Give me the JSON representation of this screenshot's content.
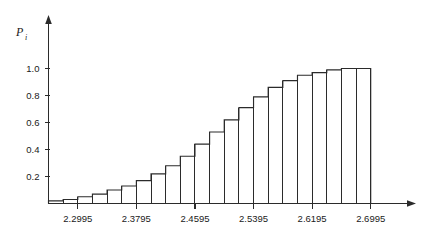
{
  "chart_data": {
    "type": "bar",
    "title": "",
    "subtitle": "",
    "xlabel": "",
    "ylabel": "P_i",
    "ylabel_base": "P",
    "ylabel_subscript": "i",
    "grid": false,
    "legend": false,
    "legend_position": "none",
    "xlim": [
      2.2595,
      2.7395
    ],
    "ylim": [
      0.0,
      1.08
    ],
    "xtick_labels": [
      "2.2995",
      "2.3795",
      "2.4595",
      "2.5395",
      "2.6195",
      "2.6995"
    ],
    "xtick_values": [
      2.2995,
      2.3795,
      2.4595,
      2.5395,
      2.6195,
      2.6995
    ],
    "xtick_step": 0.08,
    "ytick_labels": [
      "0.2",
      "0.4",
      "0.6",
      "0.8",
      "1.0"
    ],
    "ytick_values": [
      0.2,
      0.4,
      0.6,
      0.8,
      1.0
    ],
    "bar_width": 0.02,
    "categories": [
      "2.2695",
      "2.2895",
      "2.3095",
      "2.3295",
      "2.3495",
      "2.3695",
      "2.3895",
      "2.4095",
      "2.4295",
      "2.4495",
      "2.4695",
      "2.4895",
      "2.5095",
      "2.5295",
      "2.5495",
      "2.5695",
      "2.5895",
      "2.6095",
      "2.6295",
      "2.6495",
      "2.6695",
      "2.6895"
    ],
    "x": [
      2.2695,
      2.2895,
      2.3095,
      2.3295,
      2.3495,
      2.3695,
      2.3895,
      2.4095,
      2.4295,
      2.4495,
      2.4695,
      2.4895,
      2.5095,
      2.5295,
      2.5495,
      2.5695,
      2.5895,
      2.6095,
      2.6295,
      2.6495,
      2.6695,
      2.6895
    ],
    "values": [
      0.02,
      0.03,
      0.05,
      0.07,
      0.1,
      0.13,
      0.17,
      0.22,
      0.28,
      0.35,
      0.44,
      0.53,
      0.62,
      0.71,
      0.79,
      0.86,
      0.91,
      0.95,
      0.97,
      0.99,
      1.0,
      1.0
    ],
    "series": [
      {
        "name": "P_i",
        "values": [
          0.02,
          0.03,
          0.05,
          0.07,
          0.1,
          0.13,
          0.17,
          0.22,
          0.28,
          0.35,
          0.44,
          0.53,
          0.62,
          0.71,
          0.79,
          0.86,
          0.91,
          0.95,
          0.97,
          0.99,
          1.0,
          1.0
        ]
      }
    ],
    "annotations": []
  },
  "axes": {
    "y_axis_name": "vertical-axis",
    "x_axis_name": "horizontal-axis"
  }
}
